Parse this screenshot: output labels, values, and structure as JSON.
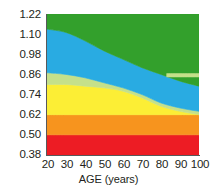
{
  "chart_data": {
    "type": "area",
    "title": "",
    "subtitle": "",
    "xlabel": "AGE (years)",
    "ylabel": "",
    "xlim": [
      20,
      100
    ],
    "ylim": [
      0.38,
      1.22
    ],
    "grid": false,
    "legend": "none",
    "x_ticks": [
      20,
      30,
      40,
      50,
      60,
      70,
      80,
      90,
      100
    ],
    "x_tick_labels": [
      "20",
      "30",
      "40",
      "50",
      "60",
      "70",
      "80",
      "90",
      "100"
    ],
    "y_ticks": [
      0.38,
      0.5,
      0.62,
      0.74,
      0.86,
      0.98,
      1.1,
      1.22
    ],
    "y_tick_labels": [
      "1.22",
      "1.10",
      "0.98",
      "0.86",
      "0.74",
      "0.62",
      "0.50",
      "0.38"
    ],
    "x": [
      20,
      30,
      40,
      50,
      60,
      70,
      80,
      90,
      100
    ],
    "bands": [
      {
        "name": "band-red",
        "color": "#ed1c24",
        "lower": [
          0.38,
          0.38,
          0.38,
          0.38,
          0.38,
          0.38,
          0.38,
          0.38,
          0.38
        ],
        "upper": [
          0.5,
          0.5,
          0.5,
          0.5,
          0.5,
          0.5,
          0.5,
          0.5,
          0.5
        ]
      },
      {
        "name": "band-orange",
        "color": "#f7941e",
        "lower": [
          0.5,
          0.5,
          0.5,
          0.5,
          0.5,
          0.5,
          0.5,
          0.5,
          0.5
        ],
        "upper": [
          0.62,
          0.62,
          0.62,
          0.62,
          0.62,
          0.62,
          0.62,
          0.62,
          0.62
        ]
      },
      {
        "name": "band-yellow",
        "color": "#fcee35",
        "lower": [
          0.62,
          0.62,
          0.62,
          0.62,
          0.62,
          0.62,
          0.62,
          0.62,
          0.62
        ],
        "upper": [
          0.8,
          0.8,
          0.79,
          0.78,
          0.76,
          0.72,
          0.67,
          0.64,
          0.62
        ]
      },
      {
        "name": "band-light-green",
        "color": "#c5e08a",
        "lower": [
          0.8,
          0.8,
          0.79,
          0.78,
          0.76,
          0.72,
          0.67,
          0.64,
          0.62
        ],
        "upper": [
          0.87,
          0.86,
          0.84,
          0.81,
          0.78,
          0.74,
          0.69,
          0.66,
          0.64
        ]
      },
      {
        "name": "band-blue",
        "color": "#29abe2",
        "lower": [
          0.87,
          0.86,
          0.84,
          0.81,
          0.78,
          0.74,
          0.69,
          0.66,
          0.64
        ],
        "upper": [
          1.13,
          1.11,
          1.06,
          1.0,
          0.95,
          0.9,
          0.86,
          0.82,
          0.79
        ]
      },
      {
        "name": "band-green",
        "color": "#33a02c",
        "lower": [
          1.13,
          1.11,
          1.06,
          1.0,
          0.95,
          0.9,
          0.86,
          0.82,
          0.79
        ],
        "upper": [
          1.22,
          1.22,
          1.22,
          1.22,
          1.22,
          1.22,
          1.22,
          1.22,
          1.22
        ]
      }
    ],
    "light_green_right_tail": {
      "name": "light-green-upper-right-wedge",
      "color": "#c5e08a",
      "x": [
        83,
        90,
        100
      ],
      "lower": [
        0.845,
        0.845,
        0.845
      ],
      "upper": [
        0.865,
        0.865,
        0.865
      ]
    }
  },
  "axes": {
    "y_label_color": "#231f20",
    "x_label_color": "#231f20",
    "axis_line_color": "#58595b"
  }
}
